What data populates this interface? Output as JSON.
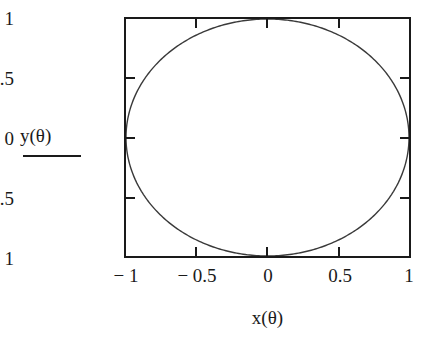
{
  "chart_data": {
    "type": "line",
    "title": "",
    "subtitle": "",
    "xlabel": "x(θ)",
    "ylabel": "y(θ)",
    "xlim": [
      -1,
      1
    ],
    "ylim": [
      -1,
      1
    ],
    "grid": false,
    "legend": null,
    "legend_position": "none",
    "xticks": [
      -1,
      -0.5,
      0,
      0.5,
      1
    ],
    "yticks": [
      -1,
      -0.5,
      0,
      0.5,
      1
    ],
    "xtick_labels": [
      "− 1",
      "− 0.5",
      "0",
      "0.5",
      "1"
    ],
    "ytick_labels": [
      "1",
      "0.5",
      "0",
      "− 0.5",
      "− 1"
    ],
    "series": [
      {
        "name": "unit circle",
        "parametric": true,
        "parameter": "θ",
        "parameter_range": [
          0,
          6.283185307179586
        ],
        "x_expression": "cos(θ)",
        "y_expression": "sin(θ)",
        "color": "#3a3a3a",
        "linewidth": 1.4,
        "x": [
          1.0,
          0.951,
          0.809,
          0.588,
          0.309,
          0.0,
          -0.309,
          -0.588,
          -0.809,
          -0.951,
          -1.0,
          -0.951,
          -0.809,
          -0.588,
          -0.309,
          0.0,
          0.309,
          0.588,
          0.809,
          0.951,
          1.0
        ],
        "y": [
          0.0,
          0.309,
          0.588,
          0.809,
          0.951,
          1.0,
          0.951,
          0.809,
          0.588,
          0.309,
          0.0,
          -0.309,
          -0.588,
          -0.809,
          -0.951,
          -1.0,
          -0.951,
          -0.809,
          -0.588,
          -0.309,
          0.0
        ]
      }
    ]
  },
  "axes": {
    "y_name": "y(θ)",
    "x_name": "x(θ)",
    "y_tick_labels": {
      "t1": "1",
      "t2": "0.5",
      "t3": "0",
      "t4": "− 0.5",
      "t5": "− 1"
    },
    "x_tick_labels": {
      "t1": "− 1",
      "t2": "− 0.5",
      "t3": "0",
      "t4": "0.5",
      "t5": "1"
    }
  },
  "style": {
    "frame_color": "#1a1a1a",
    "curve_color": "#3a3a3a",
    "background": "#ffffff",
    "text_color": "#1a1a1a"
  }
}
